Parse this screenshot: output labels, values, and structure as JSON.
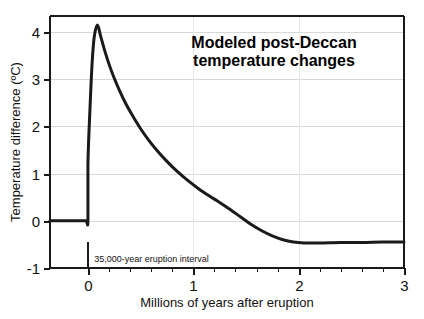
{
  "chart_data": {
    "type": "line",
    "title_line1": "Modeled post-Deccan",
    "title_line2": "temperature changes",
    "xlabel": "Millions of years after eruption",
    "ylabel": "Temperature difference (ºC)",
    "xlim": [
      -0.36,
      3.0
    ],
    "ylim": [
      -1.0,
      4.34
    ],
    "xticks": [
      0,
      1,
      2,
      3
    ],
    "xtick_labels": [
      "0",
      "1",
      "2",
      "3"
    ],
    "yticks": [
      -1,
      0,
      1,
      2,
      3,
      4
    ],
    "ytick_labels": [
      "-1",
      "0",
      "1",
      "2",
      "3",
      "4"
    ],
    "x_minor_tick_step": 0.2,
    "grid": "horizontal-gridlines-at-yticks plus faint vertical gridlines at x=1 and x=2",
    "legend": "none",
    "line_color": "#1a1a1a",
    "line_width_px": 3,
    "grid_color": "#d8d8d8",
    "axis_color": "#1a1a1a",
    "annotations": [
      {
        "name": "eruption-interval",
        "text": "35,000-year eruption interval",
        "marker_x": 0.0,
        "marker_y_top": -0.45,
        "marker_y_bottom": -1.0,
        "text_x": 0.06,
        "text_y": -0.82
      }
    ],
    "series": [
      {
        "name": "Modeled temperature difference",
        "x": [
          -0.36,
          -0.3,
          -0.2,
          -0.1,
          -0.02,
          0.0,
          0.0,
          0.02,
          0.04,
          0.06,
          0.09,
          0.12,
          0.16,
          0.2,
          0.25,
          0.3,
          0.36,
          0.42,
          0.5,
          0.58,
          0.66,
          0.75,
          0.85,
          0.95,
          1.05,
          1.15,
          1.25,
          1.35,
          1.45,
          1.55,
          1.65,
          1.75,
          1.85,
          1.95,
          2.05,
          2.2,
          2.4,
          2.6,
          2.8,
          3.0
        ],
        "y": [
          0.0,
          0.0,
          0.0,
          0.0,
          0.0,
          0.0,
          1.2,
          2.4,
          3.35,
          3.9,
          4.15,
          3.92,
          3.6,
          3.32,
          3.02,
          2.76,
          2.48,
          2.24,
          1.95,
          1.7,
          1.48,
          1.26,
          1.04,
          0.85,
          0.68,
          0.53,
          0.39,
          0.24,
          0.08,
          -0.08,
          -0.21,
          -0.32,
          -0.4,
          -0.45,
          -0.47,
          -0.47,
          -0.46,
          -0.46,
          -0.45,
          -0.45
        ],
        "peak_x": 0.09,
        "peak_y": 4.15,
        "baseline_before_eruption": 0.0,
        "asymptote_after": -0.45
      }
    ]
  },
  "figure": {
    "background": "#ffffff",
    "width": 424,
    "height": 319
  }
}
